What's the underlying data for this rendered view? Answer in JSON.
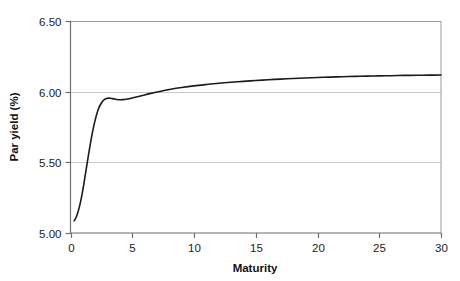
{
  "chart_data": {
    "type": "line",
    "title": "",
    "subtitle": "",
    "xlabel": "Maturity",
    "ylabel": "Par yield (%)",
    "xlim": [
      0,
      30
    ],
    "ylim": [
      5.0,
      6.5
    ],
    "xticks": [
      0,
      5,
      10,
      15,
      20,
      25,
      30
    ],
    "xticklabels": [
      "0",
      "5",
      "10",
      "15",
      "20",
      "25",
      "30"
    ],
    "yticks": [
      5.0,
      5.5,
      6.0,
      6.5
    ],
    "yticklabels": [
      "5.00",
      "5.50",
      "6.00",
      "6.50"
    ],
    "grid": "horizontal",
    "gridlines_y": [
      5.5,
      6.0,
      6.5
    ],
    "legend": null,
    "annotations": [],
    "series": [
      {
        "name": "Par yield curve",
        "color": "#1a1a1a",
        "linewidth": 1.6,
        "x": [
          0.3,
          0.5,
          0.75,
          1.0,
          1.25,
          1.5,
          1.75,
          2.0,
          2.25,
          2.5,
          2.75,
          3.0,
          3.25,
          3.5,
          3.75,
          4.0,
          4.25,
          4.5,
          4.75,
          5.0,
          5.5,
          6.0,
          6.5,
          7.0,
          7.5,
          8.0,
          9.0,
          10.0,
          11.0,
          12.0,
          13.0,
          14.0,
          15.0,
          16.0,
          17.0,
          18.0,
          19.0,
          20.0,
          21.0,
          22.0,
          23.0,
          24.0,
          25.0,
          26.0,
          27.0,
          28.0,
          29.0,
          30.0
        ],
        "y": [
          5.085,
          5.12,
          5.195,
          5.305,
          5.44,
          5.575,
          5.7,
          5.8,
          5.875,
          5.92,
          5.945,
          5.954,
          5.953,
          5.949,
          5.945,
          5.943,
          5.944,
          5.946,
          5.95,
          5.955,
          5.966,
          5.977,
          5.988,
          5.998,
          6.007,
          6.015,
          6.029,
          6.041,
          6.051,
          6.06,
          6.067,
          6.073,
          6.079,
          6.084,
          6.089,
          6.093,
          6.097,
          6.1,
          6.103,
          6.106,
          6.108,
          6.11,
          6.112,
          6.113,
          6.115,
          6.116,
          6.117,
          6.118
        ]
      }
    ]
  },
  "axes": {
    "x_axis_name": "maturity-axis",
    "y_axis_name": "par-yield-axis"
  },
  "style": {
    "background": "#ffffff",
    "axis_color": "#6e6e6e",
    "grid_color": "#c9c9c9",
    "curve_color": "#1a1a1a",
    "text_color": "#1c1c1c"
  }
}
